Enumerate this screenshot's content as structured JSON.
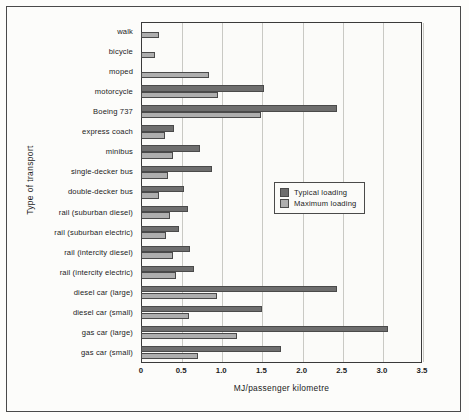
{
  "chart_data": {
    "type": "bar",
    "orientation": "horizontal",
    "title": "",
    "xlabel": "MJ/passenger kilometre",
    "ylabel": "Type of transport",
    "xlim": [
      0,
      3.5
    ],
    "xticks": [
      "0",
      "0.5",
      "1.0",
      "1.5",
      "2.0",
      "2.5",
      "3.0",
      "3.5"
    ],
    "xtick_values": [
      0,
      0.5,
      1.0,
      1.5,
      2.0,
      2.5,
      3.0,
      3.5
    ],
    "grid": true,
    "legend_position": "center-right",
    "categories": [
      "walk",
      "bicycle",
      "moped",
      "motorcycle",
      "Boeing 737",
      "express coach",
      "minibus",
      "single-decker bus",
      "double-decker bus",
      "rail (suburban diesel)",
      "rail (suburban electric)",
      "rail (intercity diesel)",
      "rail (intercity electric)",
      "diesel car (large)",
      "diesel car (small)",
      "gas car (large)",
      "gas car (small)"
    ],
    "series": [
      {
        "name": "Typical loading",
        "color": "#6e6e6e",
        "values": [
          0,
          0,
          0,
          1.53,
          2.44,
          0.41,
          0.74,
          0.89,
          0.53,
          0.59,
          0.47,
          0.61,
          0.66,
          2.44,
          1.51,
          3.08,
          1.74
        ]
      },
      {
        "name": "Maximum loading",
        "color": "#aeaeae",
        "values": [
          0.22,
          0.17,
          0.85,
          0.96,
          1.5,
          0.3,
          0.4,
          0.34,
          0.22,
          0.36,
          0.31,
          0.4,
          0.43,
          0.95,
          0.6,
          1.2,
          0.71
        ]
      }
    ]
  },
  "legend": {
    "items": [
      {
        "label": "Typical loading",
        "color": "#6e6e6e"
      },
      {
        "label": "Maximum loading",
        "color": "#aeaeae"
      }
    ]
  }
}
